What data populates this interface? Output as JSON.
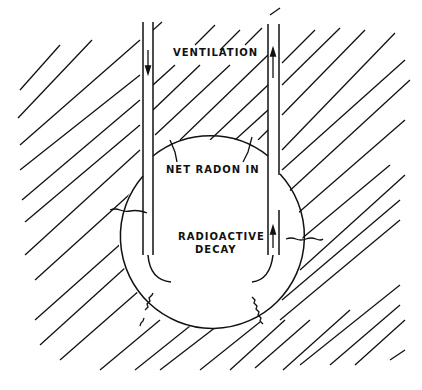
{
  "diagram": {
    "type": "cross-section",
    "labels": {
      "ventilation": "VENTILATION",
      "net_radon_in": "NET RADON IN",
      "radioactive_decay_line1": "RADIOACTIVE",
      "radioactive_decay_line2": "DECAY"
    },
    "elements": [
      {
        "id": "rock",
        "kind": "hatched-region"
      },
      {
        "id": "ventilation-shaft",
        "kind": "vertical-pipes",
        "flow": [
          "down-left",
          "up-right"
        ]
      },
      {
        "id": "cavity",
        "kind": "circle"
      },
      {
        "id": "radon-emanation-arrows",
        "kind": "wavy-arrows",
        "count": 4
      }
    ],
    "colors": {
      "ink": "#111111",
      "paper": "#ffffff"
    }
  }
}
